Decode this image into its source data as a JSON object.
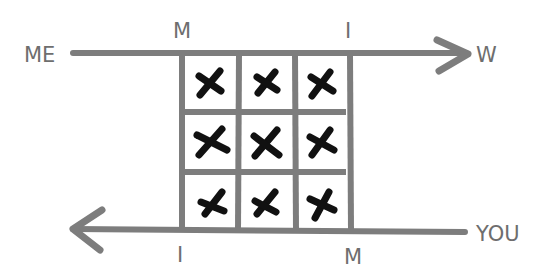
{
  "diagram": {
    "type": "matrix-between-arrows",
    "colors": {
      "line": "#7d7d7d",
      "mark": "#111111",
      "label": "#6e6e6e",
      "background": "#ffffff"
    },
    "top_arrow": {
      "start_label": "ME",
      "end_label": "W",
      "direction": "right",
      "tick_labels": [
        "M",
        "I"
      ]
    },
    "bottom_arrow": {
      "start_label": "YOU",
      "direction": "left",
      "tick_labels": [
        "I",
        "M"
      ]
    },
    "grid": {
      "rows": 3,
      "cols": 3,
      "cells": [
        [
          "X",
          "X",
          "X"
        ],
        [
          "X",
          "X",
          "X"
        ],
        [
          "X",
          "X",
          "X"
        ]
      ]
    }
  }
}
